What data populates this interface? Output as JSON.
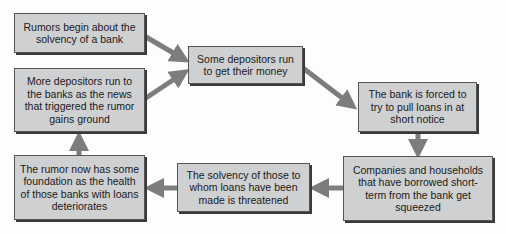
{
  "diagram": {
    "type": "flowchart",
    "colors": {
      "box_fill": "#cfd0d2",
      "box_border": "#555555",
      "arrow": "#7d7d7d",
      "background": "#fdfdfd"
    },
    "nodes": [
      {
        "id": "rumors",
        "label": "Rumors begin about the solvency of a bank"
      },
      {
        "id": "run",
        "label": "Some depositors run to get their money"
      },
      {
        "id": "pull",
        "label": "The bank is forced to try to pull loans in at short notice"
      },
      {
        "id": "squeezed",
        "label": "Companies and households that have borrowed short-term from the bank get squeezed"
      },
      {
        "id": "solvency",
        "label": "The solvency of those to whom loans have been made is threatened"
      },
      {
        "id": "foundation",
        "label": "The rumor now has some foundation as the health of those banks with loans deteriorates"
      },
      {
        "id": "more",
        "label": "More depositors run to the banks as the news that triggered the rumor gains ground"
      }
    ],
    "edges": [
      {
        "from": "rumors",
        "to": "run"
      },
      {
        "from": "more",
        "to": "run"
      },
      {
        "from": "run",
        "to": "pull"
      },
      {
        "from": "pull",
        "to": "squeezed"
      },
      {
        "from": "squeezed",
        "to": "solvency"
      },
      {
        "from": "solvency",
        "to": "foundation"
      },
      {
        "from": "foundation",
        "to": "more"
      }
    ]
  }
}
